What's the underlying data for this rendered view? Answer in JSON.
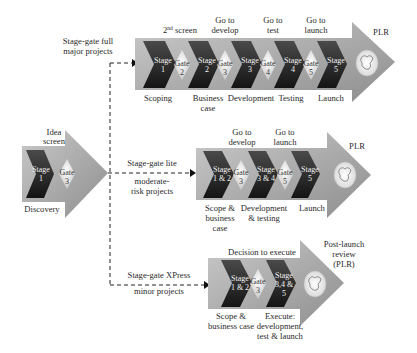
{
  "diagram": {
    "colors": {
      "band": "#a9a9a9",
      "stage": "#262626",
      "gate": "#f2f2f2",
      "line": "#222222"
    },
    "discovery": {
      "top_label_1": "Idea",
      "top_label_2": "screen",
      "stage_1": "Stage",
      "stage_2": "1",
      "gate_1": "Gate",
      "gate_2": "3",
      "bottom_label": "Discovery"
    },
    "full": {
      "track_label_1": "Stage-gate full",
      "track_label_2": "major projects",
      "top_labels": [
        {
          "l1": "2",
          "sup": "nd",
          "l1b": " screen",
          "l2": ""
        },
        {
          "l1": "Go to",
          "l2": "develop"
        },
        {
          "l1": "Go to",
          "l2": "test"
        },
        {
          "l1": "Go to",
          "l2": "launch"
        }
      ],
      "stages": [
        {
          "l1": "Stage",
          "l2": "1"
        },
        {
          "l1": "Stage",
          "l2": "2"
        },
        {
          "l1": "Stage",
          "l2": "3"
        },
        {
          "l1": "Stage",
          "l2": "4"
        },
        {
          "l1": "Stage",
          "l2": "5"
        }
      ],
      "gates": [
        {
          "l1": "Gate",
          "l2": "2"
        },
        {
          "l1": "Gate",
          "l2": "3"
        },
        {
          "l1": "Gate",
          "l2": "4"
        },
        {
          "l1": "Gate",
          "l2": "5"
        }
      ],
      "bottom_labels": [
        {
          "l1": "Scoping",
          "l2": ""
        },
        {
          "l1": "Business",
          "l2": "case"
        },
        {
          "l1": "Development",
          "l2": ""
        },
        {
          "l1": "Testing",
          "l2": ""
        },
        {
          "l1": "Launch",
          "l2": ""
        }
      ],
      "end_label": "PLR"
    },
    "lite": {
      "track_label_1": "Stage-gate lite",
      "track_label_2": "moderate-",
      "track_label_3": "risk projects",
      "top_labels": [
        {
          "l1": "Go to",
          "l2": "develop"
        },
        {
          "l1": "Go to",
          "l2": "launch"
        }
      ],
      "stages": [
        {
          "l1": "Stage",
          "l2": "1 & 2"
        },
        {
          "l1": "Stage",
          "l2": "3 & 4"
        },
        {
          "l1": "Stage",
          "l2": "5"
        }
      ],
      "gates": [
        {
          "l1": "Gate",
          "l2": "3"
        },
        {
          "l1": "Gate",
          "l2": "5"
        }
      ],
      "bottom_labels": [
        {
          "l1": "Scope &",
          "l2": "business",
          "l3": "case"
        },
        {
          "l1": "Development",
          "l2": "& testing"
        },
        {
          "l1": "Launch"
        }
      ],
      "end_label": "PLR"
    },
    "xpress": {
      "track_label_1": "Stage-gate XPress",
      "track_label_2": "minor projects",
      "top_label": "Decision to execute",
      "stages": [
        {
          "l1": "Stage",
          "l2": "1 & 2"
        },
        {
          "l1": "Stage",
          "l2": "3,4 &",
          "l3": "5"
        }
      ],
      "gates": [
        {
          "l1": "Gate",
          "l2": "3"
        }
      ],
      "bottom_labels": [
        {
          "l1": "Scope &",
          "l2": "business case"
        },
        {
          "l1": "Execute:",
          "l2": "development,",
          "l3": "test & launch"
        }
      ],
      "end_label_1": "Post-launch",
      "end_label_2": "review",
      "end_label_3": "(PLR)"
    }
  }
}
